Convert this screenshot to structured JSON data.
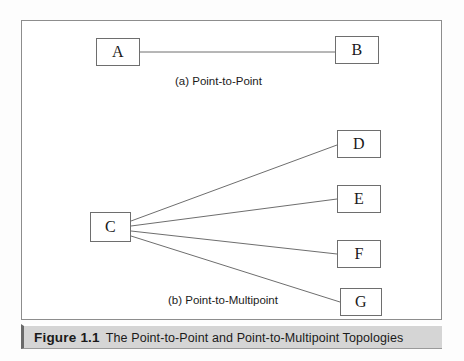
{
  "figure": {
    "caption_figure_number": "Figure 1.1",
    "caption_text": "The Point-to-Point and Point-to-Multipoint Topologies",
    "frame_border_color": "#8d8d8d",
    "caption_bar_color": "#d5d5d5",
    "line_color": "#6e6e6e",
    "background_color": "#ffffff"
  },
  "diagrams": [
    {
      "id": "point-to-point",
      "label": "(a) Point-to-Point",
      "nodes": [
        {
          "id": "A",
          "label": "A",
          "x": 96,
          "y": 38,
          "w": 44,
          "h": 28
        },
        {
          "id": "B",
          "label": "B",
          "x": 335,
          "y": 36,
          "w": 44,
          "h": 28
        }
      ],
      "links": [
        {
          "from": "A",
          "to": "B"
        }
      ]
    },
    {
      "id": "point-to-multipoint",
      "label": "(b) Point-to-Multipoint",
      "nodes": [
        {
          "id": "C",
          "label": "C",
          "x": 90,
          "y": 212,
          "w": 41,
          "h": 30
        },
        {
          "id": "D",
          "label": "D",
          "x": 337,
          "y": 130,
          "w": 44,
          "h": 28
        },
        {
          "id": "E",
          "label": "E",
          "x": 337,
          "y": 185,
          "w": 44,
          "h": 28
        },
        {
          "id": "F",
          "label": "F",
          "x": 337,
          "y": 240,
          "w": 44,
          "h": 28
        },
        {
          "id": "G",
          "label": "G",
          "x": 340,
          "y": 288,
          "w": 42,
          "h": 28
        }
      ],
      "links": [
        {
          "from": "C",
          "to": "D"
        },
        {
          "from": "C",
          "to": "E"
        },
        {
          "from": "C",
          "to": "F"
        },
        {
          "from": "C",
          "to": "G"
        }
      ]
    }
  ],
  "node_labels": {
    "a": "A",
    "b": "B",
    "c": "C",
    "d": "D",
    "e": "E",
    "f": "F",
    "g": "G"
  },
  "captions": {
    "a": "(a) Point-to-Point",
    "b": "(b) Point-to-Multipoint"
  }
}
